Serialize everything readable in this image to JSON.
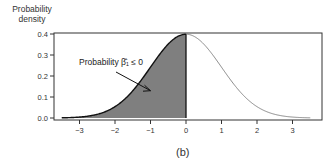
{
  "chart_data": {
    "type": "area",
    "title": "",
    "caption": "(b)",
    "xlabel": "",
    "ylabel": "Probability density",
    "ylabel_lines": [
      "Probability",
      "density"
    ],
    "xlim": [
      -3.6,
      3.8
    ],
    "ylim": [
      0.0,
      0.4
    ],
    "xticks": [
      -3,
      -2,
      -1,
      0,
      1,
      2,
      3
    ],
    "yticks": [
      0.0,
      0.1,
      0.2,
      0.3,
      0.4
    ],
    "ytick_labels": [
      "0.0",
      "0.1",
      "0.2",
      "0.3",
      "0.4"
    ],
    "xtick_labels": [
      "−3",
      "−2",
      "−1",
      "0",
      "1",
      "2",
      "3"
    ],
    "grid": false,
    "series": [
      {
        "name": "Standard normal density",
        "distribution": "normal",
        "mean": 0,
        "sd": 1,
        "x_range": [
          -3.5,
          3.5
        ],
        "peak_value": 0.399
      }
    ],
    "shaded_region": {
      "from": -3.5,
      "to": 0,
      "color": "#7f7f7f",
      "area": 0.5
    },
    "annotations": [
      {
        "text": "Probability β̂₁ ≤ 0",
        "arrow_to": [
          -1.0,
          0.13
        ]
      }
    ],
    "colors": {
      "fill": "#7f7f7f",
      "left_curve": "#111111",
      "right_curve": "#888888",
      "axis": "#333333"
    }
  },
  "labels": {
    "ylabel_line1": "Probability",
    "ylabel_line2": "density",
    "annotation": "Probability β̂₁ ≤ 0",
    "caption": "(b)"
  }
}
